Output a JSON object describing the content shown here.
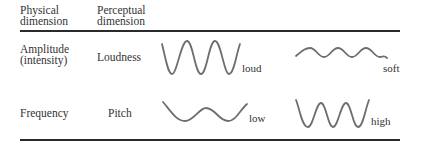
{
  "table": {
    "headers": {
      "physical": "Physical\ndimension",
      "perceptual": "Perceptual\ndimension"
    },
    "rows": [
      {
        "physical": "Amplitude\n(intensity)",
        "perceptual": "Loudness",
        "examples": [
          {
            "label": "loud",
            "wave": "high-amplitude"
          },
          {
            "label": "soft",
            "wave": "low-amplitude"
          }
        ]
      },
      {
        "physical": "Frequency",
        "perceptual": "Pitch",
        "examples": [
          {
            "label": "low",
            "wave": "low-frequency"
          },
          {
            "label": "high",
            "wave": "high-frequency"
          }
        ]
      }
    ]
  },
  "colors": {
    "text": "#333333",
    "rule": "#2a2a2a",
    "wave": "#6e6e6e"
  }
}
